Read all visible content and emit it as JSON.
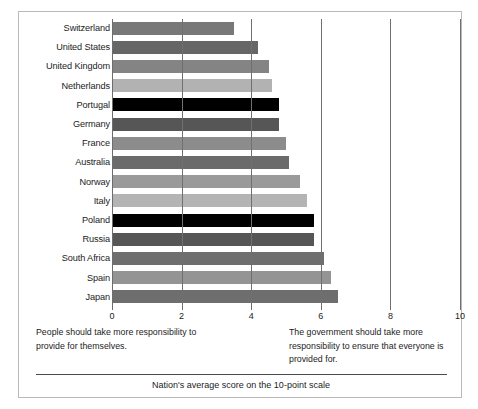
{
  "chart_data": {
    "type": "bar",
    "orientation": "horizontal",
    "title": "",
    "subtitle": "",
    "xlabel": "Nation's average score on the 10-point scale",
    "ylabel": "",
    "xlim": [
      0,
      10
    ],
    "xticks": [
      0,
      2,
      4,
      6,
      8,
      10
    ],
    "xtick_labels": [
      "0",
      "2",
      "4",
      "6",
      "8",
      "10"
    ],
    "grid": true,
    "legend": "none",
    "categories": [
      "Switzerland",
      "United States",
      "United Kingdom",
      "Netherlands",
      "Portugal",
      "Germany",
      "France",
      "Australia",
      "Norway",
      "Italy",
      "Poland",
      "Russia",
      "South Africa",
      "Spain",
      "Japan"
    ],
    "values": [
      3.5,
      4.2,
      4.5,
      4.6,
      4.8,
      4.8,
      5.0,
      5.1,
      5.4,
      5.6,
      5.8,
      5.8,
      6.1,
      6.3,
      6.5
    ],
    "bar_colors": [
      "#787878",
      "#666666",
      "#848484",
      "#b2b2b2",
      "#000000",
      "#565656",
      "#8c8c8c",
      "#6b6b6b",
      "#9a9a9a",
      "#b4b4b4",
      "#000000",
      "#565656",
      "#6e6e6e",
      "#949494",
      "#6e6e6e"
    ],
    "annotations": [
      {
        "position": "bottom-left",
        "text": "People should take more responsibility to provide for themselves."
      },
      {
        "position": "bottom-right",
        "text": "The government should take more responsibility to ensure that everyone is provided for."
      }
    ]
  },
  "figure": {
    "caption": "Nation's average score on the 10-point scale",
    "annotation_left": "People should take more responsibility to provide for themselves.",
    "annotation_right": "The government should take more responsibility to ensure that everyone is provided for."
  },
  "colors": {
    "frame_border": "#b9b9b9",
    "gridline": "#707070",
    "divider": "#4a4a4a",
    "text": "#1c1c1c",
    "background": "#ffffff"
  }
}
